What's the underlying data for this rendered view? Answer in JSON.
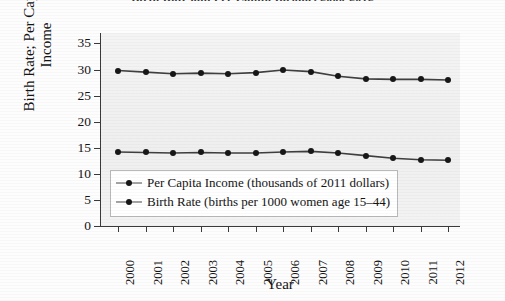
{
  "figure": {
    "title_remnant": "Birth Rate and Per Capita Income, 2000-2012",
    "xlabel": "Year",
    "ylabel_line1": "Birth Rate; Per Capita",
    "ylabel_line2": "Income"
  },
  "chart_data": {
    "type": "line",
    "title": "Birth Rate and Per Capita Income, 2000-2012",
    "xlabel": "Year",
    "ylabel": "Birth Rate; Per Capita Income",
    "categories": [
      "2000",
      "2001",
      "2002",
      "2003",
      "2004",
      "2005",
      "2006",
      "2007",
      "2008",
      "2009",
      "2010",
      "2011",
      "2012"
    ],
    "xtick_labels": [
      "2000",
      "2001",
      "2002",
      "2003",
      "2004",
      "2005",
      "2006",
      "2007",
      "2008",
      "2009",
      "2010",
      "2011",
      "2012"
    ],
    "ytick_labels": [
      "0",
      "5",
      "10",
      "15",
      "20",
      "25",
      "30",
      "35"
    ],
    "yticks": [
      0,
      5,
      10,
      15,
      20,
      25,
      30,
      35
    ],
    "ylim": [
      0,
      37
    ],
    "grid": false,
    "legend_position": "inside-lower-left",
    "marker": "filled-circle",
    "series": [
      {
        "name": "Per Capita Income (thousands of 2011 dollars)",
        "color": "#171717",
        "values": [
          29.8,
          29.5,
          29.2,
          29.3,
          29.2,
          29.4,
          29.9,
          29.6,
          28.7,
          28.2,
          28.1,
          28.1,
          28.0
        ]
      },
      {
        "name": "Birth Rate (births per 1000 women age 15-44)",
        "color": "#171717",
        "values": [
          14.2,
          14.1,
          14.0,
          14.1,
          14.0,
          14.0,
          14.2,
          14.3,
          14.0,
          13.5,
          13.0,
          12.7,
          12.6
        ]
      }
    ],
    "legend": [
      "Per Capita Income (thousands of 2011 dollars)",
      "Birth Rate (births per 1000 women age 15–44)"
    ]
  }
}
